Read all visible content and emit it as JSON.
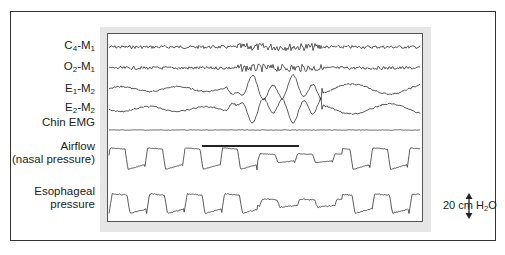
{
  "figure": {
    "type": "polysomnography-tracing",
    "channels": [
      {
        "id": "c4m1",
        "base": "C",
        "sub1": "4",
        "mid": "-M",
        "sub2": "1",
        "label_y": 46,
        "trace_y": 14,
        "kind": "eeg"
      },
      {
        "id": "o2m1",
        "base": "O",
        "sub1": "2",
        "mid": "-M",
        "sub2": "1",
        "label_y": 67,
        "trace_y": 35,
        "kind": "eeg"
      },
      {
        "id": "e1m2",
        "base": "E",
        "sub1": "1",
        "mid": "-M",
        "sub2": "2",
        "label_y": 89,
        "trace_y": 56,
        "kind": "eog-left"
      },
      {
        "id": "e2m2",
        "base": "E",
        "sub1": "2",
        "mid": "-M",
        "sub2": "2",
        "label_y": 108,
        "trace_y": 76,
        "kind": "eog-right"
      },
      {
        "id": "chin",
        "text": "Chin EMG",
        "label_y": 123,
        "trace_y": 97,
        "kind": "emg"
      },
      {
        "id": "airflow",
        "text": "Airflow",
        "text2": "(nasal pressure)",
        "label_y": 147,
        "trace_y": 125,
        "kind": "airflow"
      },
      {
        "id": "esoph",
        "text": "Esophageal",
        "text2": "pressure",
        "label_y": 192,
        "trace_y": 170,
        "kind": "esophageal"
      }
    ],
    "event_bar": {
      "x1": 95,
      "x2": 192,
      "y": 113
    },
    "scale_bar": {
      "value": "20 cm H",
      "sub": "2",
      "suffix": "O"
    },
    "colors": {
      "trace": "#333333",
      "panel": "#e6e6e6",
      "frame": "#333333"
    }
  }
}
